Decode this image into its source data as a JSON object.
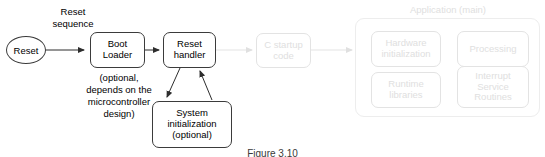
{
  "diagram": {
    "caption": "Figure 3.10",
    "nodes": {
      "reset": {
        "label": "Reset"
      },
      "boot_loader": {
        "label": "Boot\nLoader"
      },
      "reset_handler": {
        "label": "Reset\nhandler"
      },
      "system_init": {
        "label": "System\ninitialization\n(optional)"
      },
      "c_startup": {
        "label": "C startup\ncode"
      },
      "hardware_init": {
        "label": "Hardware\ninitialization"
      },
      "processing": {
        "label": "Processing"
      },
      "runtime_libraries": {
        "label": "Runtime\nlibraries"
      },
      "interrupt_service_routines": {
        "label": "Interrupt\nService\nRoutines"
      }
    },
    "groups": {
      "application": {
        "title": "Application (main)"
      }
    },
    "annotations": {
      "reset_sequence": "Reset\nsequence",
      "boot_loader_note": "(optional,\ndepends on the\nmicrocontroller\ndesign)"
    },
    "colors": {
      "stroke": "#3b3b3b",
      "faded_stroke": "#e3e3e3",
      "faded_text": "#e0e0e0",
      "text": "#000000",
      "background": "#ffffff"
    }
  }
}
